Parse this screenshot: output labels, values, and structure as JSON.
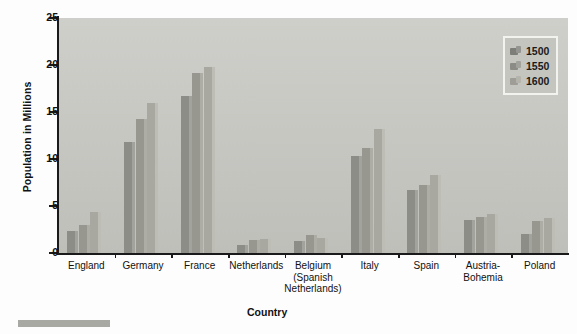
{
  "chart_data": {
    "type": "bar",
    "title": "",
    "xlabel": "Country",
    "ylabel": "Population in Millions",
    "ylim": [
      0,
      25
    ],
    "yticks": [
      0,
      5,
      10,
      15,
      20,
      25
    ],
    "grid": false,
    "legend_position": "top-right",
    "categories": [
      "England",
      "Germany",
      "France",
      "Netherlands",
      "Belgium (Spanish Netherlands)",
      "Italy",
      "Spain",
      "Austria-Bohemia",
      "Poland"
    ],
    "category_lines": [
      [
        "England"
      ],
      [
        "Germany"
      ],
      [
        "France"
      ],
      [
        "Netherlands"
      ],
      [
        "Belgium",
        "(Spanish",
        "Netherlands)"
      ],
      [
        "Italy"
      ],
      [
        "Spain"
      ],
      [
        "Austria-",
        "Bohemia"
      ],
      [
        "Poland"
      ]
    ],
    "series": [
      {
        "name": "1500",
        "values": [
          2.3,
          11.8,
          16.7,
          0.9,
          1.3,
          10.3,
          6.7,
          3.5,
          2.0
        ]
      },
      {
        "name": "1550",
        "values": [
          3.0,
          14.3,
          19.2,
          1.4,
          1.9,
          11.2,
          7.2,
          3.8,
          3.4
        ]
      },
      {
        "name": "1600",
        "values": [
          4.4,
          16.0,
          19.8,
          1.5,
          1.6,
          13.2,
          8.3,
          4.1,
          3.7
        ]
      }
    ]
  },
  "legend": {
    "items": [
      {
        "label": "1500"
      },
      {
        "label": "1550"
      },
      {
        "label": "1600"
      }
    ]
  },
  "colors": {
    "plot_background": "#c9c9c4",
    "axis": "#1a1a1a",
    "series_1500": "#8d8d88",
    "series_1550": "#97978f",
    "series_1600": "#a8a8a0"
  }
}
